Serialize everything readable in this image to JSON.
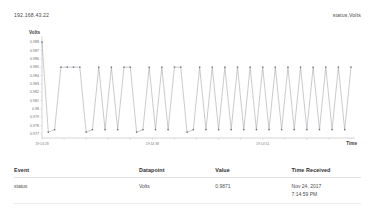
{
  "header": {
    "device_address": "192.168.43.22",
    "stream_label": "status,Volts"
  },
  "chart_data": {
    "type": "line",
    "title": "",
    "xlabel": "Time",
    "ylabel": "Volts",
    "ylim": [
      0.9765,
      0.9885
    ],
    "grid": false,
    "legend": "none",
    "series_name": "status,Volts",
    "line_color": "#9aa0a6",
    "marker_color": "#6b7076",
    "y_ticks": [
      0.988,
      0.987,
      0.986,
      0.985,
      0.984,
      0.983,
      0.982,
      0.981,
      0.98,
      0.979,
      0.978,
      0.977
    ],
    "x_ticks": [
      "19:14:28",
      "",
      "",
      "",
      "",
      "19:14:38",
      "",
      "",
      "",
      "",
      "19:14:51",
      "",
      "",
      "",
      ""
    ],
    "x_tick_labeled": [
      "19:14:28",
      "19:14:38",
      "19:14:51"
    ],
    "x": [
      0,
      1,
      2,
      3,
      4,
      5,
      6,
      7,
      8,
      9,
      10,
      11,
      12,
      13,
      14,
      15,
      16,
      17,
      18,
      19,
      20,
      21,
      22,
      23,
      24,
      25,
      26,
      27,
      28,
      29,
      30,
      31,
      32,
      33,
      34,
      35,
      36,
      37,
      38,
      39,
      40,
      41,
      42,
      43,
      44,
      45,
      46,
      47,
      48,
      49
    ],
    "values": [
      0.988,
      0.9772,
      0.9775,
      0.985,
      0.985,
      0.985,
      0.985,
      0.9772,
      0.9775,
      0.985,
      0.9775,
      0.985,
      0.9775,
      0.985,
      0.985,
      0.9772,
      0.9775,
      0.985,
      0.9775,
      0.985,
      0.9775,
      0.985,
      0.985,
      0.9772,
      0.9775,
      0.985,
      0.9775,
      0.985,
      0.9775,
      0.985,
      0.9775,
      0.985,
      0.9775,
      0.985,
      0.9775,
      0.985,
      0.9775,
      0.985,
      0.9775,
      0.985,
      0.9775,
      0.985,
      0.9775,
      0.985,
      0.9775,
      0.985,
      0.9775,
      0.985,
      0.9775,
      0.985
    ]
  },
  "table": {
    "columns": [
      "Event",
      "Datapoint",
      "Value",
      "Time Received"
    ],
    "rows": [
      {
        "event": "status",
        "datapoint": "Volts",
        "value": "0.9871",
        "time_date": "Nov 24, 2017",
        "time_clock": "7:14:59 PM"
      }
    ]
  }
}
